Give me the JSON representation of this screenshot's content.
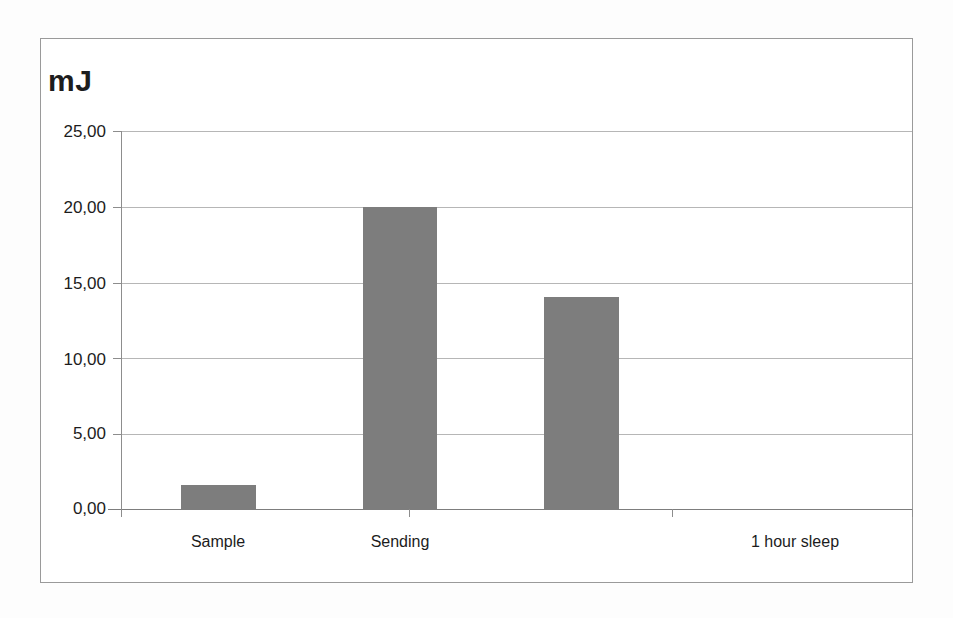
{
  "chart_data": {
    "type": "bar",
    "title": "",
    "subtitle": "",
    "xlabel": "",
    "ylabel": "mJ",
    "unit_label": "mJ",
    "categories": [
      "Sample",
      "Sending",
      "1 hour sleep"
    ],
    "values": [
      1.6,
      20.0,
      14.0
    ],
    "series": [
      {
        "name": "Energy",
        "values": [
          1.6,
          20.0,
          14.0
        ]
      }
    ],
    "ylim": [
      0,
      25
    ],
    "y_tick_values": [
      0,
      5,
      10,
      15,
      20,
      25
    ],
    "y_tick_labels": [
      "0,00",
      "5,00",
      "10,00",
      "15,00",
      "20,00",
      "25,00"
    ],
    "decimal_separator": ",",
    "grid": true,
    "grid_axis": "y",
    "legend": false,
    "legend_position": "none",
    "bar_color": "#7d7d7d",
    "grid_color": "#b6b6b6",
    "axis_color": "#8d8d8d",
    "background_color": "#ffffff",
    "frame_color": "#9a9a9a",
    "text_color": "#1c1c1c"
  },
  "axis": {
    "y_unit_caption": "mJ"
  }
}
